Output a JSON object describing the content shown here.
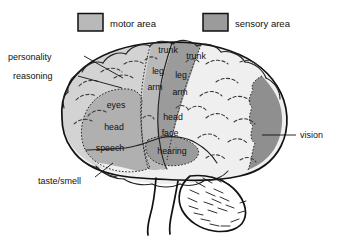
{
  "figure": {
    "background": "#ffffff"
  },
  "legend": {
    "items": [
      {
        "label": "motor area",
        "swatch_color": "#b9b9b9",
        "icon": "square-swatch-icon"
      },
      {
        "label": "sensory area",
        "swatch_color": "#9b9b9b",
        "icon": "square-swatch-icon"
      }
    ]
  },
  "colors": {
    "motor": "#b9b9b9",
    "sensory": "#9b9b9b",
    "frontal_light": "#d3d3d3",
    "parietal_pale": "#efefef",
    "association_mid": "#b0b0b0",
    "vision_dark": "#8f8f8f",
    "outline": "#111111",
    "background": "#ffffff"
  },
  "callouts": {
    "left": [
      {
        "label": "personality",
        "x": 8,
        "y": 60
      },
      {
        "label": "reasoning",
        "x": 13,
        "y": 79
      },
      {
        "label": "taste/smell",
        "x": 38,
        "y": 184
      }
    ],
    "right": [
      {
        "label": "vision",
        "x": 300,
        "y": 138
      }
    ]
  },
  "regions": {
    "motor_strip": {
      "name": "motor area",
      "labels": [
        "trunk",
        "leg",
        "arm"
      ]
    },
    "sensory_strip": {
      "name": "sensory area",
      "labels": [
        "trunk",
        "leg",
        "arm",
        "head",
        "face"
      ]
    },
    "frontal_blob": {
      "name": "eyes head speech area",
      "labels": [
        "eyes",
        "head",
        "speech"
      ]
    },
    "temporal_blob": {
      "name": "hearing area",
      "labels": [
        "hearing"
      ]
    },
    "occipital": {
      "name": "vision area",
      "labels": []
    }
  },
  "inner_labels": [
    {
      "key": "motor-trunk",
      "text": "trunk",
      "x": 168,
      "y": 53
    },
    {
      "key": "motor-leg",
      "text": "leg",
      "x": 158,
      "y": 74
    },
    {
      "key": "motor-arm",
      "text": "arm",
      "x": 155,
      "y": 90
    },
    {
      "key": "sensory-trunk",
      "text": "trunk",
      "x": 196,
      "y": 59
    },
    {
      "key": "sensory-leg",
      "text": "leg",
      "x": 181,
      "y": 78
    },
    {
      "key": "sensory-arm",
      "text": "arm",
      "x": 180,
      "y": 95
    },
    {
      "key": "sensory-head",
      "text": "head",
      "x": 173,
      "y": 120
    },
    {
      "key": "sensory-face",
      "text": "face",
      "x": 170,
      "y": 136
    },
    {
      "key": "blob-eyes",
      "text": "eyes",
      "x": 116,
      "y": 108
    },
    {
      "key": "blob-head",
      "text": "head",
      "x": 114,
      "y": 130
    },
    {
      "key": "blob-speech",
      "text": "speech",
      "x": 104,
      "y": 150
    },
    {
      "key": "temporal-hearing",
      "text": "hearing",
      "x": 162,
      "y": 153
    }
  ]
}
